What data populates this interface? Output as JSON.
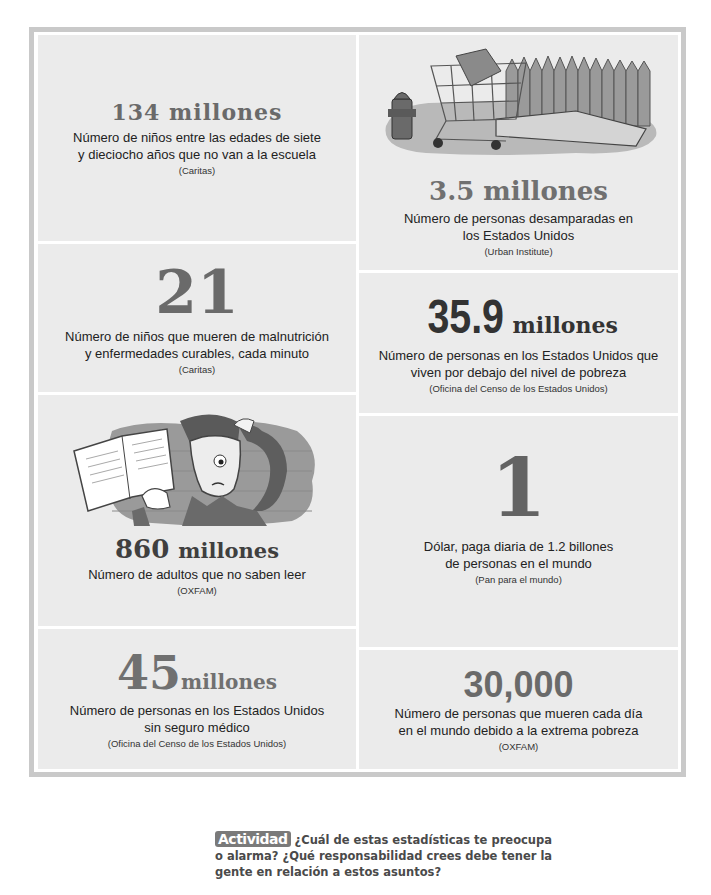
{
  "stats": [
    {
      "id": "children-out-of-school",
      "number": "134",
      "unit": "millones",
      "description_lines": [
        "Número de niños entre las edades de siete",
        "y dieciocho años que no van a la escuela"
      ],
      "source": "(Caritas)"
    },
    {
      "id": "homeless-us",
      "number": "3.5",
      "unit": "millones",
      "description_lines": [
        "Número de personas desamparadas en",
        "los Estados Unidos"
      ],
      "source": "(Urban Institute)",
      "illustration": "homeless-scene-illustration"
    },
    {
      "id": "children-dying-per-minute",
      "number": "21",
      "unit": "",
      "description_lines": [
        "Número de niños que mueren de malnutrición",
        "y enfermedades curables, cada minuto"
      ],
      "source": "(Caritas)"
    },
    {
      "id": "poverty-us",
      "number": "35.9",
      "unit": "millones",
      "description_lines": [
        "Número de personas en los Estados Unidos que",
        "viven por debajo del nivel de pobreza"
      ],
      "source": "(Oficina del Censo de los Estados Unidos)"
    },
    {
      "id": "illiterate-adults",
      "number": "860",
      "unit": "millones",
      "description_lines": [
        "Número de adultos que no saben leer"
      ],
      "source": "(OXFAM)",
      "illustration": "confused-reader-illustration"
    },
    {
      "id": "one-dollar-daily",
      "number": "1",
      "unit": "",
      "description_lines": [
        "Dólar, paga diaria de 1.2 billones",
        "de personas en el mundo"
      ],
      "source": "(Pan para el mundo)"
    },
    {
      "id": "uninsured-us",
      "number": "45",
      "unit": "millones",
      "description_lines": [
        "Número de personas en los Estados Unidos",
        "sin seguro médico"
      ],
      "source": "(Oficina del Censo de los Estados Unidos)"
    },
    {
      "id": "daily-poverty-deaths",
      "number": "30,000",
      "unit": "",
      "description_lines": [
        "Número de personas que mueren cada día",
        "en el mundo debido a la extrema pobreza"
      ],
      "source": "(OXFAM)"
    }
  ],
  "activity": {
    "badge": "Actividad",
    "text": "¿Cuál de estas estadísticas te preocupa o alarma? ¿Qué responsabilidad crees debe tener la gente en relación a estos asuntos?"
  },
  "colors": {
    "panel_bg": "#ebebeb",
    "frame": "#c9c9c9",
    "number_grey": "#6a6a6a",
    "number_dark": "#3a3a3a"
  }
}
